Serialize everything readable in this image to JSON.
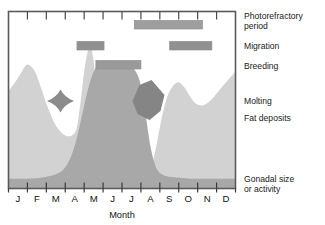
{
  "chart_data": {
    "type": "area",
    "title": "",
    "xlabel": "Month",
    "ylabel": "",
    "categories": [
      "J",
      "F",
      "M",
      "A",
      "M",
      "J",
      "J",
      "A",
      "S",
      "O",
      "N",
      "D"
    ],
    "xlim": [
      0,
      12
    ],
    "ylim": [
      0,
      1
    ],
    "grid": false,
    "legend_position": "right",
    "series": [
      {
        "name": "Fat deposits",
        "type": "area",
        "color": "#d2d2d2",
        "x": [
          0.0,
          0.35,
          0.7,
          1.0,
          1.4,
          1.75,
          2.0,
          2.3,
          2.6,
          3.0,
          3.35,
          3.6,
          3.8,
          4.0,
          4.2,
          4.35,
          4.5,
          4.7,
          5.0,
          5.4,
          5.8,
          6.2,
          6.6,
          7.0,
          7.35,
          7.6,
          7.85,
          8.1,
          8.4,
          8.7,
          9.0,
          9.3,
          9.6,
          9.9,
          10.3,
          10.7,
          11.1,
          11.5,
          12.0
        ],
        "values": [
          0.55,
          0.6,
          0.66,
          0.7,
          0.66,
          0.56,
          0.48,
          0.4,
          0.34,
          0.3,
          0.3,
          0.34,
          0.48,
          0.66,
          0.78,
          0.8,
          0.72,
          0.52,
          0.28,
          0.16,
          0.1,
          0.07,
          0.06,
          0.06,
          0.08,
          0.14,
          0.26,
          0.4,
          0.52,
          0.58,
          0.6,
          0.57,
          0.52,
          0.48,
          0.47,
          0.5,
          0.55,
          0.6,
          0.66
        ]
      },
      {
        "name": "Gonadal size or activity",
        "type": "area",
        "color": "#a8a8a8",
        "x": [
          0.0,
          0.8,
          1.6,
          2.2,
          2.7,
          3.0,
          3.3,
          3.6,
          3.9,
          4.2,
          4.5,
          4.8,
          5.1,
          5.4,
          5.8,
          6.2,
          6.6,
          6.9,
          7.1,
          7.3,
          7.5,
          7.7,
          7.9,
          8.2,
          8.6,
          9.2,
          9.8,
          10.6,
          11.3,
          12.0
        ],
        "values": [
          0.055,
          0.055,
          0.06,
          0.07,
          0.09,
          0.12,
          0.18,
          0.28,
          0.42,
          0.56,
          0.66,
          0.7,
          0.72,
          0.72,
          0.72,
          0.71,
          0.68,
          0.62,
          0.52,
          0.38,
          0.24,
          0.15,
          0.1,
          0.075,
          0.065,
          0.06,
          0.055,
          0.055,
          0.055,
          0.055
        ]
      }
    ],
    "event_bars": [
      {
        "name": "Photorefractory period",
        "label": "Photorefractory\nperiod",
        "label_line1": "Photorefractory",
        "label_line2": "period",
        "color": "#9e9e9e",
        "start_month": 6.65,
        "end_month": 10.25,
        "row": 0
      },
      {
        "name": "Migration",
        "label": "Migration",
        "color": "#909090",
        "segments": [
          {
            "start_month": 3.62,
            "end_month": 5.05
          },
          {
            "start_month": 8.52,
            "end_month": 10.75
          }
        ],
        "row": 1
      },
      {
        "name": "Breeding",
        "label": "Breeding",
        "color": "#9a9a9a",
        "start_month": 4.62,
        "end_month": 7.0,
        "row": 2
      }
    ],
    "molting_shapes": [
      {
        "name": "molting-spring",
        "center_month": 2.75,
        "color": "#8c8c8c"
      },
      {
        "name": "molting-late-summer",
        "center_month": 7.4,
        "color": "#858585"
      }
    ],
    "legend_labels": [
      {
        "key": "photorefractory",
        "line1": "Photorefractory",
        "line2": "period"
      },
      {
        "key": "migration",
        "line1": "Migration",
        "line2": ""
      },
      {
        "key": "breeding",
        "line1": "Breeding",
        "line2": ""
      },
      {
        "key": "molting",
        "line1": "Molting",
        "line2": ""
      },
      {
        "key": "fat_deposits",
        "line1": "Fat deposits",
        "line2": ""
      },
      {
        "key": "gonadal",
        "line1": "Gonadal size",
        "line2": "or activity"
      }
    ]
  },
  "axis": {
    "month_title": "Month",
    "tick_labels": [
      "J",
      "F",
      "M",
      "A",
      "M",
      "J",
      "J",
      "A",
      "S",
      "O",
      "N",
      "D"
    ]
  },
  "legend": {
    "photorefractory_l1": "Photorefractory",
    "photorefractory_l2": "period",
    "migration": "Migration",
    "breeding": "Breeding",
    "molting": "Molting",
    "fat_deposits": "Fat deposits",
    "gonadal_l1": "Gonadal size",
    "gonadal_l2": "or activity"
  },
  "colors": {
    "frame": "#5a5a5a",
    "fat_area": "#d2d2d2",
    "gonadal_area": "#a8a8a8",
    "event_bar": "#9a9a9a",
    "molting": "#8a8a8a",
    "text": "#111111",
    "background": "#ffffff"
  }
}
